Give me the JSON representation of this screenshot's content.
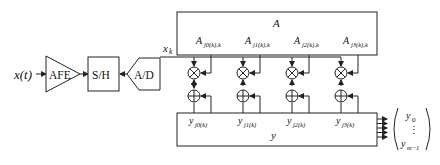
{
  "diagram": {
    "input_label": "x(t)",
    "blocks": {
      "afe": "AFE",
      "sample_hold": "S/H",
      "adc": "A/D"
    },
    "sample_label": "x",
    "sample_sub": "k",
    "matrix_A": {
      "title": "A",
      "entries": [
        {
          "base": "A",
          "sub": "j0(k),k"
        },
        {
          "base": "A",
          "sub": "j1(k),k"
        },
        {
          "base": "A",
          "sub": "j2(k),k"
        },
        {
          "base": "A",
          "sub": "j3(k),k"
        }
      ]
    },
    "operators": {
      "multiply_symbol": "⊗",
      "add_symbol": "⊕",
      "count": 4
    },
    "vector_y": {
      "title": "y",
      "entries": [
        {
          "base": "y",
          "sub": "j0(k)"
        },
        {
          "base": "y",
          "sub": "j1(k)"
        },
        {
          "base": "y",
          "sub": "j2(k)"
        },
        {
          "base": "y",
          "sub": "j3(k)"
        }
      ]
    },
    "output_vector": {
      "top": "y",
      "top_sub": "0",
      "dots": "⋮",
      "bottom": "y",
      "bottom_sub": "m−1"
    },
    "colors": {
      "stroke": "#222222",
      "background": "#ffffff"
    }
  }
}
